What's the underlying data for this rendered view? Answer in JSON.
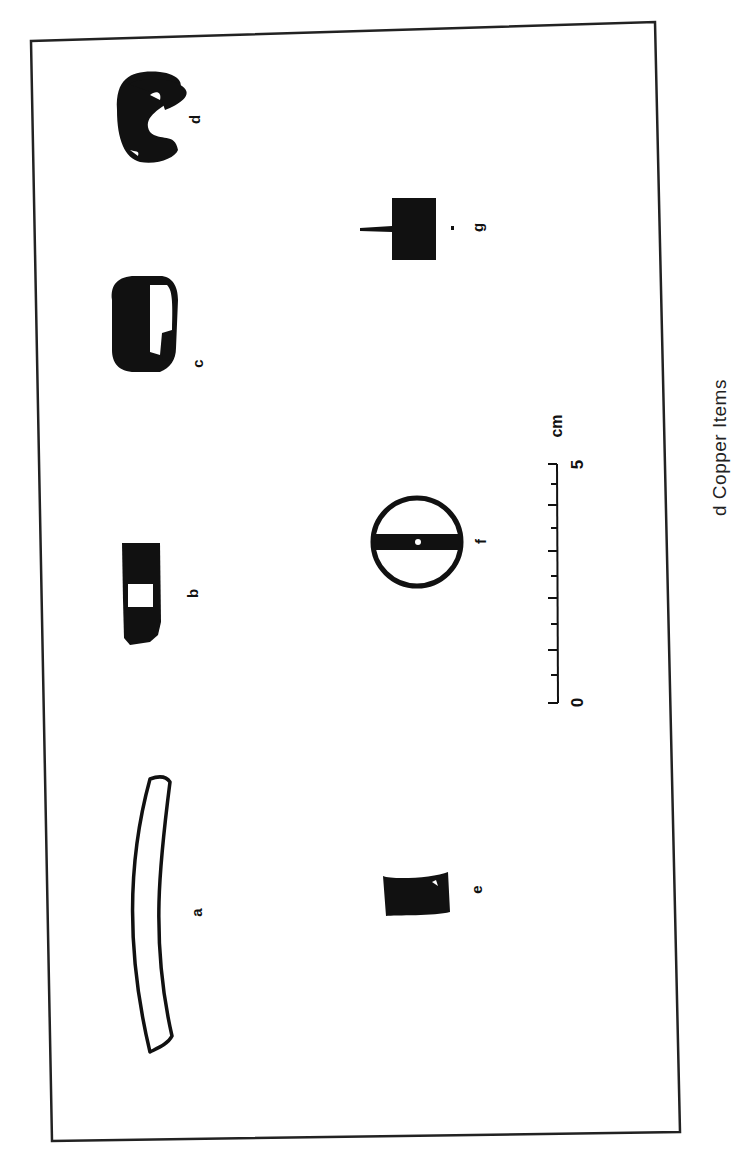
{
  "figure": {
    "caption_visible": "d Copper Items",
    "caption_fragments": [
      "",
      "d",
      "Copper",
      "Items"
    ],
    "orientation": "rotated 90° counter-clockwise",
    "items": [
      {
        "id": "a",
        "label": "a",
        "description": "long curved bar, outlined"
      },
      {
        "id": "b",
        "label": "b",
        "description": "rectangular dark fragment with light inset"
      },
      {
        "id": "c",
        "label": "c",
        "description": "rounded dark nugget with light patch"
      },
      {
        "id": "d",
        "label": "d",
        "description": "dark C-shaped ring fragment"
      },
      {
        "id": "e",
        "label": "e",
        "description": "small dark concave block"
      },
      {
        "id": "f",
        "label": "f",
        "description": "circular disc with central bar and hole"
      },
      {
        "id": "g",
        "label": "g",
        "description": "dark square with projecting pin"
      }
    ],
    "scale_bar": {
      "start_label": "0",
      "end_label": "5",
      "unit": "cm",
      "major_ticks": 5,
      "minor_ticks": 5
    },
    "colors": {
      "ink": "#111111",
      "paper": "#ffffff"
    }
  }
}
